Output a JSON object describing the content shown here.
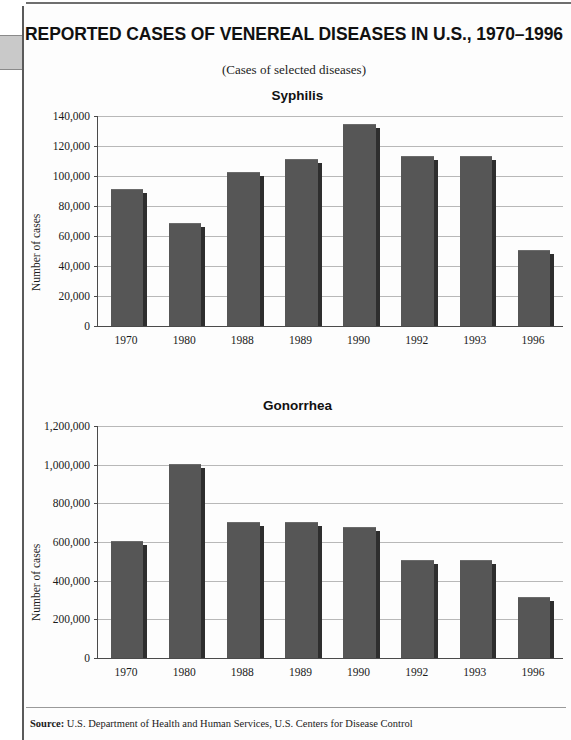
{
  "header": {
    "title": "REPORTED CASES OF VENEREAL DISEASES IN U.S., 1970–1996",
    "subtitle": "(Cases of selected diseases)"
  },
  "footer": {
    "source_label": "Source:",
    "source_text": "U.S. Department of Health and Human Services, U.S. Centers for Disease Control"
  },
  "colors": {
    "bar_fill": "#565656",
    "bar_shadow": "#2e2e2e",
    "gridline": "#b8b8b8",
    "axis": "#4a4a4a"
  },
  "chart_data": [
    {
      "type": "bar",
      "title": "Syphilis",
      "xlabel": "",
      "ylabel": "Number of cases",
      "categories": [
        "1970",
        "1980",
        "1988",
        "1989",
        "1990",
        "1992",
        "1993",
        "1996"
      ],
      "values": [
        91000,
        68000,
        102000,
        111000,
        134000,
        113000,
        113000,
        50000
      ],
      "ylim": [
        0,
        140000
      ],
      "ytick_values": [
        0,
        20000,
        40000,
        60000,
        80000,
        100000,
        120000,
        140000
      ],
      "ytick_labels": [
        "0",
        "20,000",
        "40,000",
        "60,000",
        "80,000",
        "100,000",
        "120,000",
        "140,000"
      ],
      "grid": true,
      "legend": "none"
    },
    {
      "type": "bar",
      "title": "Gonorrhea",
      "xlabel": "",
      "ylabel": "Number of cases",
      "categories": [
        "1970",
        "1980",
        "1988",
        "1989",
        "1990",
        "1992",
        "1993",
        "1996"
      ],
      "values": [
        600000,
        1000000,
        700000,
        700000,
        675000,
        500000,
        500000,
        310000
      ],
      "ylim": [
        0,
        1200000
      ],
      "ytick_values": [
        0,
        200000,
        400000,
        600000,
        800000,
        1000000,
        1200000
      ],
      "ytick_labels": [
        "0",
        "200,000",
        "400,000",
        "600,000",
        "800,000",
        "1,000,000",
        "1,200,000"
      ],
      "grid": true,
      "legend": "none"
    }
  ]
}
